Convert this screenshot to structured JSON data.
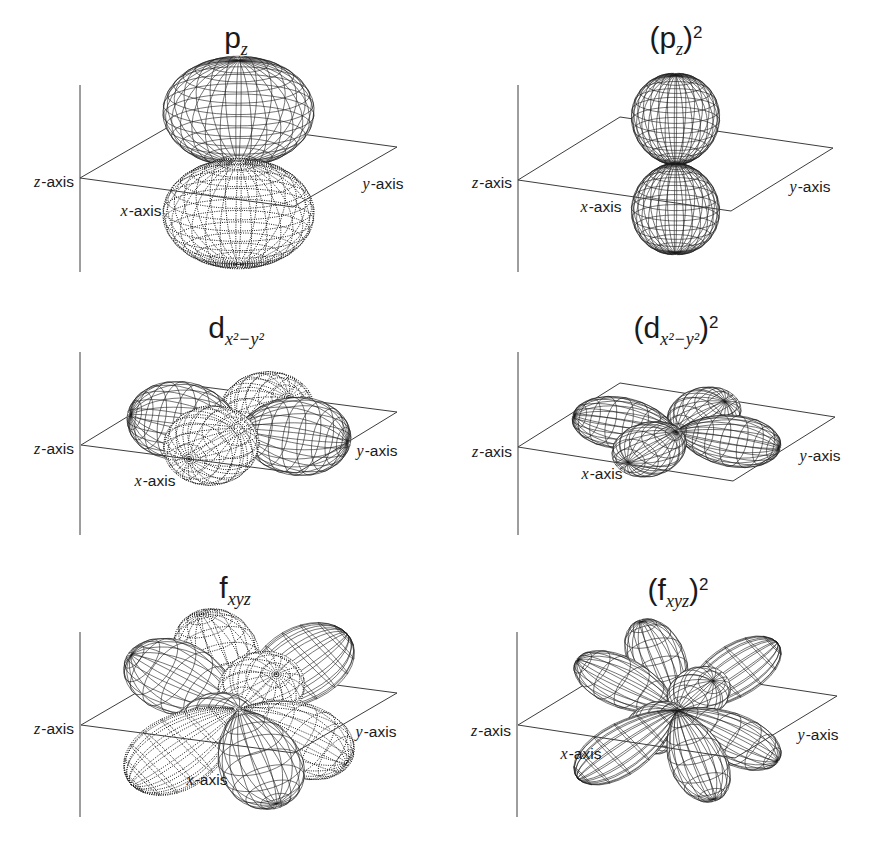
{
  "figure": {
    "background": "#ffffff",
    "ink": "#1a1a1a",
    "plane_line_color": "#3d3d3d"
  },
  "panels": [
    {
      "id": "pz",
      "title": {
        "pre": "",
        "base": "p",
        "sub": "z",
        "post": "",
        "sup": ""
      },
      "axis_labels": {
        "z": {
          "var": "z",
          "rest": "-axis"
        },
        "x": {
          "var": "x",
          "rest": "-axis"
        },
        "y": {
          "var": "y",
          "rest": "-axis"
        }
      },
      "render": {
        "C": [
          238.5,
          162.5
        ],
        "X": [
          106.5,
          14.5
        ],
        "Y": [
          52,
          -30
        ],
        "Z": [
          0,
          -102
        ],
        "zline": {
          "x": 80,
          "y1": 85,
          "y2": 272
        },
        "title_pos": [
          236,
          38
        ],
        "labels": {
          "z": [
            74,
            182
          ],
          "x": [
            141,
            211
          ],
          "y": [
            383,
            184
          ]
        },
        "orbital": {
          "type": "p",
          "q": 1,
          "k": 1,
          "scale": [
            1.28,
            1.28,
            1
          ],
          "squared": false
        }
      }
    },
    {
      "id": "pz-squared",
      "title": {
        "pre": "(",
        "base": "p",
        "sub": "z",
        "post": ")",
        "sup": "2"
      },
      "axis_labels": {
        "z": {
          "var": "z",
          "rest": "-axis"
        },
        "x": {
          "var": "x",
          "rest": "-axis"
        },
        "y": {
          "var": "y",
          "rest": "-axis"
        }
      },
      "render": {
        "C": [
          675.5,
          164
        ],
        "X": [
          106.5,
          15.5
        ],
        "Y": [
          51,
          -31.5
        ],
        "Z": [
          0,
          -89
        ],
        "zline": {
          "x": 518,
          "y1": 85,
          "y2": 272
        },
        "title_pos": [
          676,
          38
        ],
        "labels": {
          "z": [
            512,
            183
          ],
          "x": [
            601,
            207
          ],
          "y": [
            810,
            187
          ]
        },
        "orbital": {
          "type": "p",
          "q": 1,
          "k": 1.5,
          "scale": [
            0.87,
            0.87,
            1
          ],
          "squared": true
        }
      }
    },
    {
      "id": "dx2-y2",
      "title": {
        "pre": "",
        "base": "d",
        "sub": "x²−y²",
        "post": "",
        "sup": ""
      },
      "axis_labels": {
        "z": {
          "var": "z",
          "rest": "-axis"
        },
        "x": {
          "var": "x",
          "rest": "-axis"
        },
        "y": {
          "var": "y",
          "rest": "-axis"
        }
      },
      "render": {
        "C": [
          239,
          428.5
        ],
        "X": [
          108,
          14
        ],
        "Y": [
          50,
          -30.5
        ],
        "Z": [
          0,
          -95
        ],
        "zline": {
          "x": 80,
          "y1": 352,
          "y2": 535
        },
        "title_pos": [
          236,
          328
        ],
        "labels": {
          "z": [
            74,
            449
          ],
          "x": [
            155,
            481
          ],
          "y": [
            377,
            451
          ]
        },
        "orbital": {
          "type": "d",
          "q": 1.35,
          "k": 1,
          "scale": [
            1,
            1,
            1
          ],
          "squared": false
        }
      }
    },
    {
      "id": "dx2-y2-squared",
      "title": {
        "pre": "(",
        "base": "d",
        "sub": "x²−y²",
        "post": ")",
        "sup": "2"
      },
      "axis_labels": {
        "z": {
          "var": "z",
          "rest": "-axis"
        },
        "x": {
          "var": "x",
          "rest": "-axis"
        },
        "y": {
          "var": "y",
          "rest": "-axis"
        }
      },
      "render": {
        "C": [
          676.5,
          432
        ],
        "X": [
          107.5,
          17
        ],
        "Y": [
          51,
          -32
        ],
        "Z": [
          0,
          -90
        ],
        "zline": {
          "x": 518,
          "y1": 352,
          "y2": 535
        },
        "title_pos": [
          676,
          328
        ],
        "labels": {
          "z": [
            512,
            452
          ],
          "x": [
            602,
            474
          ],
          "y": [
            820,
            456
          ]
        },
        "orbital": {
          "type": "d",
          "q": 1.35,
          "k": 2,
          "scale": [
            0.95,
            0.95,
            0.9
          ],
          "squared": true
        }
      }
    },
    {
      "id": "fxyz",
      "title": {
        "pre": "",
        "base": "f",
        "sub": "xyz",
        "post": "",
        "sup": ""
      },
      "axis_labels": {
        "z": {
          "var": "z",
          "rest": "-axis"
        },
        "x": {
          "var": "x",
          "rest": "-axis"
        },
        "y": {
          "var": "y",
          "rest": "-axis"
        }
      },
      "render": {
        "C": [
          239,
          709
        ],
        "X": [
          106.5,
          14
        ],
        "Y": [
          51.5,
          -30
        ],
        "Z": [
          0,
          -95
        ],
        "zline": {
          "x": 80,
          "y1": 632,
          "y2": 817
        },
        "title_pos": [
          235,
          588
        ],
        "labels": {
          "z": [
            74,
            729
          ],
          "x": [
            207,
            780
          ],
          "y": [
            376,
            732
          ]
        },
        "orbital": {
          "type": "f",
          "q": 1.8,
          "k": 1,
          "scale": [
            1.18,
            1.18,
            1.18
          ],
          "squared": false
        }
      }
    },
    {
      "id": "fxyz-squared",
      "title": {
        "pre": "(",
        "base": "f",
        "sub": "xyz",
        "post": ")",
        "sup": "2"
      },
      "axis_labels": {
        "z": {
          "var": "z",
          "rest": "-axis"
        },
        "x": {
          "var": "x",
          "rest": "-axis"
        },
        "y": {
          "var": "y",
          "rest": "-axis"
        }
      },
      "render": {
        "C": [
          677.5,
          710.5
        ],
        "X": [
          108.5,
          16.5
        ],
        "Y": [
          51,
          -31
        ],
        "Z": [
          0,
          -95
        ],
        "zline": {
          "x": 517,
          "y1": 632,
          "y2": 817
        },
        "title_pos": [
          678,
          590
        ],
        "labels": {
          "z": [
            511,
            731
          ],
          "x": [
            581,
            754
          ],
          "y": [
            818,
            735
          ]
        },
        "orbital": {
          "type": "f",
          "q": 1.8,
          "k": 2,
          "scale": [
            1.08,
            1.08,
            1.08
          ],
          "squared": true
        }
      }
    }
  ]
}
